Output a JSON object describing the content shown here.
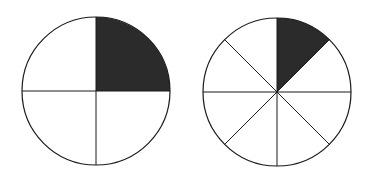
{
  "figure": {
    "description": "Two fraction circles showing equivalent fractions",
    "stroke_color": "#1a1a1a",
    "fill_color": "#2b2b2b",
    "background": "#ffffff"
  },
  "circles": [
    {
      "name": "quarters-circle",
      "cx": 96,
      "cy": 91,
      "r": 74,
      "divisions": 4,
      "shaded_parts": 1,
      "fraction_label": "1/4"
    },
    {
      "name": "eighths-circle",
      "cx": 277,
      "cy": 92,
      "r": 74,
      "divisions": 8,
      "shaded_parts": 1,
      "fraction_label": "1/8"
    }
  ]
}
